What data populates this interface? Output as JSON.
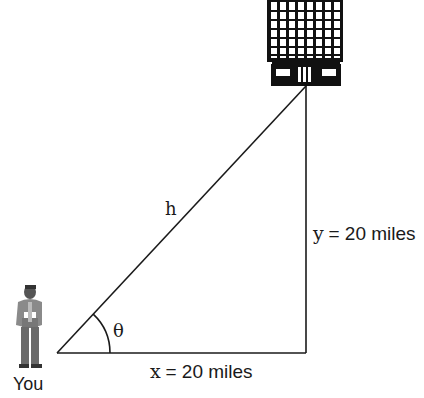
{
  "diagram": {
    "type": "right-triangle",
    "labels": {
      "hypotenuse": "h",
      "angle": "θ",
      "vertical_var": "y",
      "vertical_value": "= 20 miles",
      "horizontal_var": "x",
      "horizontal_value": "= 20 miles",
      "person": "You"
    },
    "elements": {
      "person_icon": "standing-man-icon",
      "building_icon": "skyscraper-icon"
    },
    "colors": {
      "line": "#1a1a1a",
      "background": "#ffffff"
    }
  }
}
